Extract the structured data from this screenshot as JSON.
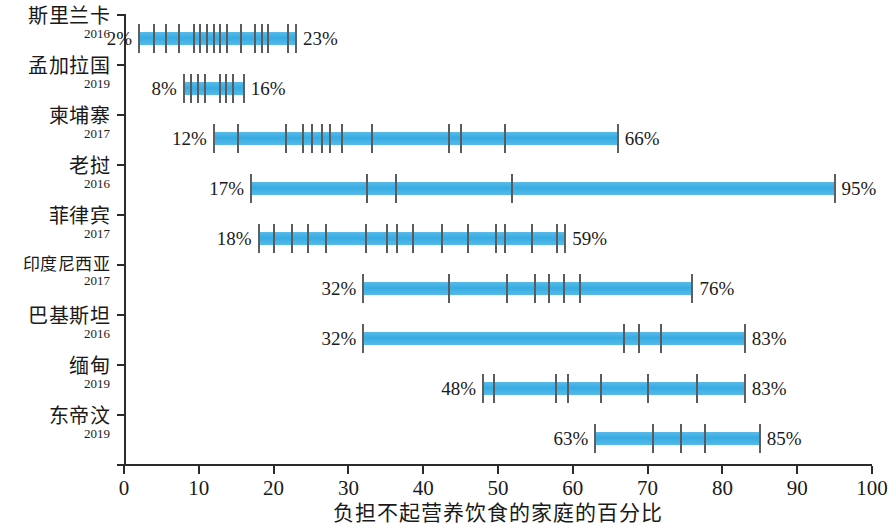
{
  "chart_data": {
    "type": "bar",
    "title": "",
    "xlabel": "负担不起营养饮食的家庭的百分比",
    "ylabel": "",
    "xlim": [
      0,
      100
    ],
    "grid": false,
    "legend": null,
    "orientation": "horizontal",
    "value_unit": "%",
    "x_ticks": [
      0,
      10,
      20,
      30,
      40,
      50,
      60,
      70,
      80,
      90,
      100
    ],
    "x_tick_labels": [
      "0",
      "10",
      "20",
      "30",
      "40",
      "50",
      "60",
      "70",
      "80",
      "90",
      "100"
    ],
    "categories": [
      {
        "name": "斯里兰卡",
        "year": "2016",
        "low": 2,
        "high": 23,
        "low_label": "2%",
        "high_label": "23%",
        "marks": [
          4.0,
          5.6,
          7.4,
          9.3,
          10.2,
          11.1,
          12.0,
          12.9,
          13.8,
          15.6,
          17.5,
          18.4,
          19.3,
          21.9
        ]
      },
      {
        "name": "孟加拉国",
        "year": "2019",
        "low": 8,
        "high": 16,
        "low_label": "8%",
        "high_label": "16%",
        "marks": [
          9.0,
          9.9,
          10.8,
          12.8,
          13.7,
          14.6
        ]
      },
      {
        "name": "柬埔寨",
        "year": "2017",
        "low": 12,
        "high": 66,
        "low_label": "12%",
        "high_label": "66%",
        "marks": [
          15.3,
          21.6,
          23.9,
          25.2,
          26.5,
          27.6,
          29.2,
          33.2,
          43.5,
          45.0,
          51.0
        ]
      },
      {
        "name": "老挝",
        "year": "2016",
        "low": 17,
        "high": 95,
        "low_label": "17%",
        "high_label": "95%",
        "marks": [
          32.5,
          36.4,
          51.9
        ]
      },
      {
        "name": "菲律宾",
        "year": "2017",
        "low": 18,
        "high": 59,
        "low_label": "18%",
        "high_label": "59%",
        "marks": [
          20.0,
          22.5,
          24.6,
          27.0,
          32.4,
          35.2,
          36.5,
          38.6,
          42.5,
          46.0,
          49.7,
          50.9,
          54.6,
          57.9
        ]
      },
      {
        "name": "印度尼西亚",
        "year": "2017",
        "low": 32,
        "high": 76,
        "low_label": "32%",
        "high_label": "76%",
        "marks": [
          43.5,
          51.2,
          54.9,
          56.8,
          58.8,
          61.0
        ]
      },
      {
        "name": "巴基斯坦",
        "year": "2016",
        "low": 32,
        "high": 83,
        "low_label": "32%",
        "high_label": "83%",
        "marks": [
          66.8,
          68.8,
          71.8
        ]
      },
      {
        "name": "缅甸",
        "year": "2019",
        "low": 48,
        "high": 83,
        "low_label": "48%",
        "high_label": "83%",
        "marks": [
          49.4,
          57.8,
          59.3,
          63.8,
          70.0,
          76.6
        ]
      },
      {
        "name": "东帝汶",
        "year": "2019",
        "low": 63,
        "high": 85,
        "low_label": "63%",
        "high_label": "85%",
        "marks": [
          70.7,
          74.5,
          77.7
        ]
      }
    ],
    "colors": {
      "bar": "#41B0E4",
      "tick": "#5b5b5b",
      "axis": "#2b2b2b",
      "text": "#1a1a1a"
    }
  }
}
